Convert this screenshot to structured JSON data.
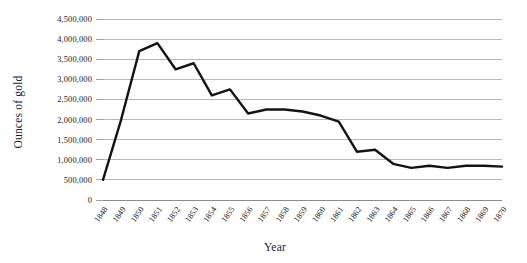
{
  "chart_data": {
    "type": "line",
    "title": "",
    "xlabel": "Year",
    "ylabel": "Ounces of gold",
    "grid": true,
    "legend": "none",
    "xlim": [
      1848,
      1870
    ],
    "ylim": [
      0,
      4500000
    ],
    "categories": [
      "1848",
      "1849",
      "1850",
      "1851",
      "1852",
      "1853",
      "1854",
      "1855",
      "1856",
      "1857",
      "1858",
      "1859",
      "1860",
      "1861",
      "1862",
      "1863",
      "1864",
      "1865",
      "1866",
      "1867",
      "1868",
      "1869",
      "1870"
    ],
    "x": [
      1848,
      1849,
      1850,
      1851,
      1852,
      1853,
      1854,
      1855,
      1856,
      1857,
      1858,
      1859,
      1860,
      1861,
      1862,
      1863,
      1864,
      1865,
      1866,
      1867,
      1868,
      1869,
      1870
    ],
    "values": [
      500000,
      2000000,
      3700000,
      3900000,
      3250000,
      3400000,
      2600000,
      2750000,
      2150000,
      2250000,
      2250000,
      2200000,
      2100000,
      1950000,
      1200000,
      1250000,
      900000,
      800000,
      850000,
      800000,
      850000,
      850000,
      830000
    ],
    "series": [
      {
        "name": "Ounces of gold",
        "color": "#131313",
        "values": [
          500000,
          2000000,
          3700000,
          3900000,
          3250000,
          3400000,
          2600000,
          2750000,
          2150000,
          2250000,
          2250000,
          2200000,
          2100000,
          1950000,
          1200000,
          1250000,
          900000,
          800000,
          850000,
          800000,
          850000,
          850000,
          830000
        ]
      }
    ],
    "ytick_labels": [
      "0",
      "500,000",
      "1,000,000",
      "1,500,000",
      "2,000,000",
      "2,500,000",
      "3,000,000",
      "3,500,000",
      "4,000,000",
      "4,500,000"
    ],
    "ytick_values": [
      0,
      500000,
      1000000,
      1500000,
      2000000,
      2500000,
      3000000,
      3500000,
      4000000,
      4500000
    ],
    "ystep": 500000,
    "colors": {
      "line": "#131313",
      "grid": "#9a9a9a",
      "axis": "#6f6f6f",
      "text": "#1b1b1b",
      "background": "#ffffff"
    }
  }
}
